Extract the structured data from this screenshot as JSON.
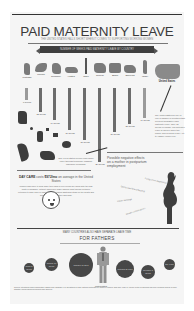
{
  "header": {
    "title": "PAID MATERNITY LEAVE",
    "subtitle": "THE UNITED STATES FALLS SHORT WHEN IT COMES TO SUPPORTING WORKING WOMEN",
    "banner": "NUMBER OF WEEKS PAID MATERNITY LEAVE BY COUNTRY"
  },
  "countries": [
    {
      "name": "Portugal",
      "weeks": "6 weeks"
    },
    {
      "name": "Mexico",
      "weeks": "12 weeks"
    },
    {
      "name": "Germany",
      "weeks": "14 weeks"
    },
    {
      "name": "Austria",
      "weeks": "16 weeks"
    },
    {
      "name": "Chile",
      "weeks": "18 weeks"
    },
    {
      "name": "Greece",
      "weeks": "26 weeks"
    },
    {
      "name": "Spain",
      "weeks": "16 weeks"
    },
    {
      "name": "Slovenia",
      "weeks": "15 weeks"
    },
    {
      "name": "Israel",
      "weeks": "14 weeks"
    }
  ],
  "us": {
    "label": "United States",
    "note": "The United States is one of only a handful of countries that does not guarantee paid maternity leave. Only 12 weeks of unpaid, job-protected leave is offered under the Family and Medical Leave Act to eligible employees."
  },
  "states": {
    "labels": [
      "New Jersey",
      "Rhode Island",
      "California",
      "Hawaii",
      "New York"
    ],
    "note": "Only a few states provide paid family leave through temporary disability insurance programs."
  },
  "effects": {
    "title": "Possible negative effects on a mother in postpartum employment",
    "items": [
      "Postpartum depression",
      "Decreased breastfeeding",
      "Lower earnings",
      "Health complications"
    ]
  },
  "daycare": {
    "prefix": "DAY CARE",
    "mid": "costs",
    "amount": "$972/mo",
    "suffix": "on average in the United States",
    "body": "Women who have to work while their child is very young are faced with the high costs of childcare. Without paid leave many families must choose between returning to work early or losing income, placing additional strain on the health and wellbeing of both mother and child."
  },
  "fathers": {
    "heading": "MANY COUNTRIES ALSO HAVE SEPARATE LEAVE TIME",
    "title": "FOR FATHERS",
    "circles": [
      {
        "label": "Spain 2 weeks"
      },
      {
        "label": "Norway 10 weeks"
      },
      {
        "label": "Sweden 60 days"
      },
      {
        "label": "Portugal 20 days"
      },
      {
        "label": "Germany 8 weeks"
      },
      {
        "label": "Italy 1 day"
      }
    ],
    "man_label": "United States"
  },
  "sources": "Sources: International Labour Organization; OECD Family Database; U.S. Department of Labor; National Partnership for Women & Families; Child Care Aware of America; Center for Economic and Policy Research; Bureau of Labor Statistics; various national government labor agencies."
}
